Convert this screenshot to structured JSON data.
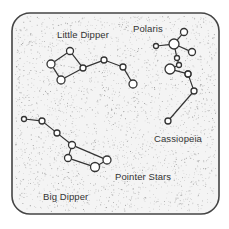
{
  "diagram": {
    "colors": {
      "background": "#ffffff",
      "panel_fill": "#f4f4f4",
      "border": "#444444",
      "stipple": "#8a8a8a",
      "star_stroke": "#333333",
      "star_fill": "#ffffff",
      "line": "#333333",
      "label": "#333333"
    },
    "panel": {
      "x": 12,
      "y": 13,
      "width": 207,
      "height": 201,
      "corner_radius": 18
    },
    "labels": {
      "little_dipper": "Little Dipper",
      "polaris": "Polaris",
      "cassiopeia": "Cassiopeia",
      "big_dipper": "Big Dipper",
      "pointer_stars": "Pointer Stars"
    },
    "label_positions": {
      "little_dipper": {
        "x": 57,
        "y": 29
      },
      "polaris": {
        "x": 133,
        "y": 23
      },
      "cassiopeia": {
        "x": 154,
        "y": 133
      },
      "big_dipper": {
        "x": 43,
        "y": 191
      },
      "pointer_stars": {
        "x": 115,
        "y": 171
      }
    },
    "constellations": [
      {
        "name": "Little Dipper",
        "stars": [
          {
            "x": 70,
            "y": 51,
            "r": 3.5
          },
          {
            "x": 51,
            "y": 64,
            "r": 4
          },
          {
            "x": 61,
            "y": 80,
            "r": 4
          },
          {
            "x": 83,
            "y": 68,
            "r": 3
          },
          {
            "x": 104,
            "y": 60,
            "r": 3
          },
          {
            "x": 123,
            "y": 67,
            "r": 3
          },
          {
            "x": 133,
            "y": 84,
            "r": 4
          }
        ],
        "lines": [
          [
            0,
            1
          ],
          [
            1,
            2
          ],
          [
            2,
            3
          ],
          [
            3,
            0
          ],
          [
            3,
            4
          ],
          [
            4,
            5
          ],
          [
            5,
            6
          ]
        ]
      },
      {
        "name": "Polaris group",
        "stars": [
          {
            "x": 184,
            "y": 32,
            "r": 3.5
          },
          {
            "x": 174,
            "y": 44,
            "r": 5
          },
          {
            "x": 156,
            "y": 46,
            "r": 2.5
          },
          {
            "x": 192,
            "y": 52,
            "r": 3.5
          },
          {
            "x": 177,
            "y": 58,
            "r": 2.5
          },
          {
            "x": 179,
            "y": 65,
            "r": 2.5
          },
          {
            "x": 170,
            "y": 69,
            "r": 5
          },
          {
            "x": 188,
            "y": 74,
            "r": 3
          }
        ],
        "lines": [
          [
            0,
            1
          ],
          [
            2,
            1
          ],
          [
            1,
            3
          ],
          [
            1,
            4
          ],
          [
            4,
            5
          ],
          [
            5,
            6
          ],
          [
            6,
            7
          ]
        ]
      },
      {
        "name": "Cassiopeia",
        "stars": [
          {
            "x": 188,
            "y": 74,
            "r": 3
          },
          {
            "x": 194,
            "y": 91,
            "r": 3
          },
          {
            "x": 168,
            "y": 121,
            "r": 3
          }
        ],
        "lines": [
          [
            0,
            1
          ],
          [
            1,
            2
          ]
        ]
      },
      {
        "name": "Big Dipper",
        "stars": [
          {
            "x": 24,
            "y": 119,
            "r": 2.5
          },
          {
            "x": 42,
            "y": 121,
            "r": 3
          },
          {
            "x": 57,
            "y": 133,
            "r": 3
          },
          {
            "x": 72,
            "y": 145,
            "r": 3.5
          },
          {
            "x": 107,
            "y": 160,
            "r": 4
          },
          {
            "x": 95,
            "y": 167,
            "r": 4.5
          },
          {
            "x": 68,
            "y": 158,
            "r": 3.5
          }
        ],
        "lines": [
          [
            0,
            1
          ],
          [
            1,
            2
          ],
          [
            2,
            3
          ],
          [
            3,
            4
          ],
          [
            4,
            5
          ],
          [
            5,
            6
          ],
          [
            6,
            3
          ]
        ]
      }
    ]
  }
}
